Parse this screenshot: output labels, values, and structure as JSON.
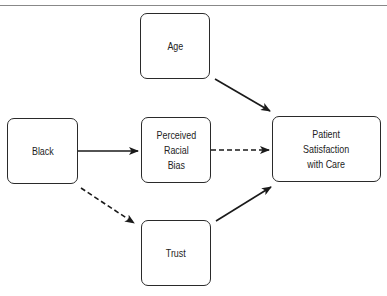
{
  "diagram": {
    "nodes": [
      {
        "id": "age",
        "label": "Age"
      },
      {
        "id": "black",
        "label": "Black"
      },
      {
        "id": "bias",
        "label": "Perceived\nRacial\nBias"
      },
      {
        "id": "satisfaction",
        "label": "Patient\nSatisfaction\nwith Care"
      },
      {
        "id": "trust",
        "label": "Trust"
      }
    ],
    "edges": [
      {
        "from": "age",
        "to": "satisfaction",
        "style": "solid"
      },
      {
        "from": "black",
        "to": "bias",
        "style": "solid"
      },
      {
        "from": "bias",
        "to": "satisfaction",
        "style": "dashed"
      },
      {
        "from": "black",
        "to": "trust",
        "style": "dashed"
      },
      {
        "from": "trust",
        "to": "satisfaction",
        "style": "solid"
      }
    ]
  }
}
